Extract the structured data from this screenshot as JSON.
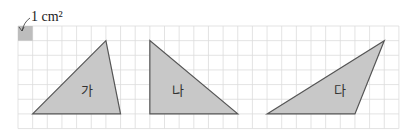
{
  "unit_label": "1 cm²",
  "grid": {
    "x0": 18,
    "y0": 26,
    "cell": 14.65,
    "cols": 26,
    "rows": 7,
    "line_color": "#dcdcdc"
  },
  "shape_fill": "#c8c8c8",
  "shape_stroke": "#555555",
  "unit_square_fill": "#bdbdbd",
  "triangles": [
    {
      "label": "가",
      "points": [
        [
          1,
          6
        ],
        [
          6,
          1
        ],
        [
          7,
          6
        ]
      ],
      "label_pos": [
        4.3,
        4.7
      ]
    },
    {
      "label": "나",
      "points": [
        [
          9,
          1
        ],
        [
          9,
          6
        ],
        [
          15,
          6
        ]
      ],
      "label_pos": [
        10.5,
        4.7
      ]
    },
    {
      "label": "다",
      "points": [
        [
          17,
          6
        ],
        [
          25,
          1
        ],
        [
          23,
          6
        ]
      ],
      "label_pos": [
        21.6,
        4.7
      ]
    }
  ]
}
